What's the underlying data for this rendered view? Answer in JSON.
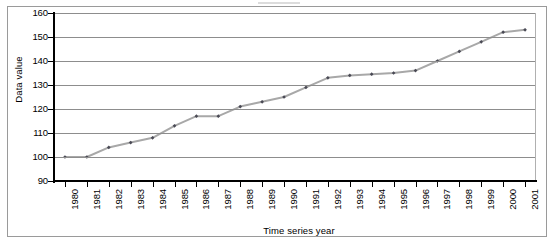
{
  "chart_data": {
    "type": "line",
    "title": "",
    "xlabel": "Time series year",
    "ylabel": "Data value",
    "categories": [
      "1980",
      "1981",
      "1982",
      "1983",
      "1984",
      "1985",
      "1986",
      "1987",
      "1988",
      "1989",
      "1990",
      "1991",
      "1992",
      "1993",
      "1994",
      "1995",
      "1996",
      "1997",
      "1998",
      "1999",
      "2000",
      "2001"
    ],
    "x": [
      1980,
      1981,
      1982,
      1983,
      1984,
      1985,
      1986,
      1987,
      1988,
      1989,
      1990,
      1991,
      1992,
      1993,
      1994,
      1995,
      1996,
      1997,
      1998,
      1999,
      2000,
      2001
    ],
    "values": [
      100,
      100,
      104,
      106,
      108,
      113,
      117,
      117,
      121,
      123,
      125,
      129,
      133,
      134,
      134.5,
      135,
      136,
      140,
      144,
      148,
      152,
      153
    ],
    "ylim": [
      90,
      160
    ],
    "yticks": [
      90,
      100,
      110,
      120,
      130,
      140,
      150,
      160
    ],
    "ytick_labels": [
      "90",
      "100",
      "110",
      "120",
      "130",
      "140",
      "150",
      "160"
    ],
    "xtick_labels": [
      "1980",
      "1981",
      "1982",
      "1983",
      "1984",
      "1985",
      "1986",
      "1987",
      "1988",
      "1989",
      "1990",
      "1991",
      "1992",
      "1993",
      "1994",
      "1995",
      "1996",
      "1997",
      "1998",
      "1999",
      "2000",
      "2001"
    ],
    "grid": true,
    "grid_axis": "y",
    "legend": false,
    "legend_position": "none",
    "marker": "diamond",
    "marker_color": "#4a4a55",
    "line_color": "#a8a8a8",
    "series": [
      {
        "name": "Data value",
        "values": [
          100,
          100,
          104,
          106,
          108,
          113,
          117,
          117,
          121,
          123,
          125,
          129,
          133,
          134,
          134.5,
          135,
          136,
          140,
          144,
          148,
          152,
          153
        ]
      }
    ]
  },
  "axes": {
    "y_title": "Data value",
    "x_title": "Time series year"
  },
  "colors": {
    "line": "#a8a8a8",
    "marker": "#4a4a55",
    "grid": "#8d8d8d",
    "axis": "#000000",
    "frame": "#9a9a9a",
    "background": "#ffffff"
  }
}
